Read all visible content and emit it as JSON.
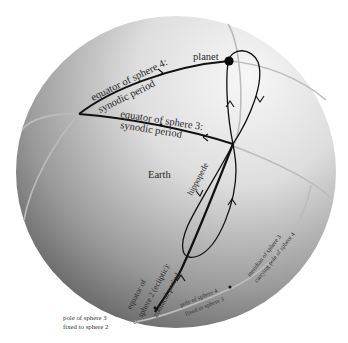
{
  "figure": {
    "colors": {
      "background": "#ffffff",
      "sphere_light": "#f2f2f2",
      "sphere_dark": "#5a5a5a",
      "great_circle": "#b9b9b9",
      "curve": "#111111"
    }
  },
  "labels": {
    "planet": "planet",
    "equator_sphere4_line1": "equator  of  sphere 4:",
    "equator_sphere4_line2": "synodic period",
    "equator_sphere3_line1": "equator   of sphere 3:",
    "equator_sphere3_line2": "synodic  period",
    "earth": "Earth",
    "hippopede": "hippopede",
    "equator_sphere2_line1": "equator of",
    "equator_sphere2_line2": "sphere 2 (ecliptic):",
    "equator_sphere2_line3": "zodiacal period",
    "meridian_line1": "meridian of sphere 3",
    "meridian_line2": "carrying pole of sphere 4",
    "pole4_line1": "pole of sphere 4",
    "pole4_line2": "fixed to sphere 3",
    "pole3_line1": "pole of sphere 3",
    "pole3_line2": "fixed to sphere 2"
  }
}
